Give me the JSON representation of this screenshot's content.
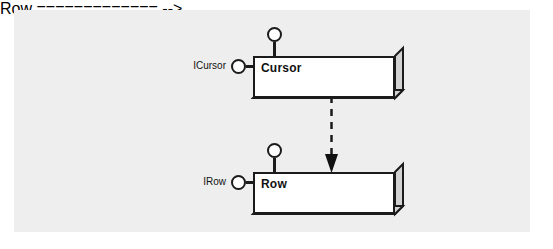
{
  "diagram": {
    "type": "uml-component-diagram",
    "background_color": "#ffffff",
    "panel_color": "#eeeeef",
    "line_color": "#1b1b1b",
    "component_fill": "#ffffff",
    "components": [
      {
        "name": "cursor",
        "label": "Cursor",
        "interfaces": [
          {
            "name": "icursor",
            "label": "ICursor",
            "position": "left"
          },
          {
            "name": "cursor-top",
            "label": "",
            "position": "top"
          }
        ]
      },
      {
        "name": "row",
        "label": "Row",
        "interfaces": [
          {
            "name": "irow",
            "label": "IRow",
            "position": "left"
          },
          {
            "name": "row-top",
            "label": "",
            "position": "top"
          }
        ]
      }
    ],
    "relationships": [
      {
        "name": "cursor-depends-on-row",
        "kind": "dependency",
        "style": "dashed",
        "arrowhead": "filled-triangle",
        "from": "Cursor",
        "to": "Row"
      }
    ]
  }
}
